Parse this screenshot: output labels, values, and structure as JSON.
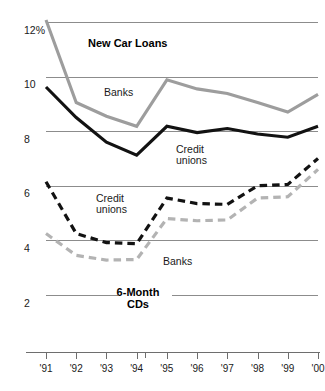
{
  "chart_data": {
    "type": "line",
    "title": "",
    "xlabel": "",
    "ylabel": "",
    "grid": true,
    "legend_position": "inline-annotations",
    "ylim": [
      2,
      12.8
    ],
    "yticks": [
      12,
      10,
      8,
      6,
      4,
      2
    ],
    "ytick_labels": [
      "12%",
      "10",
      "8",
      "6",
      "4",
      "2"
    ],
    "x": [
      "'91",
      "'92",
      "'93",
      "'94",
      "'95",
      "'96",
      "'97",
      "'98",
      "'99",
      "'00"
    ],
    "xlim": [
      "'91",
      "'00"
    ],
    "group_labels": {
      "upper": "New Car Loans",
      "lower_line1": "6-Month",
      "lower_line2": "CDs"
    },
    "annotations": [
      {
        "text": "New Car Loans",
        "x_px": 88,
        "y_px": 47,
        "bold": true
      },
      {
        "text": "Banks",
        "x_px": 104,
        "y_px": 96,
        "bold": false
      },
      {
        "text": "Credit",
        "x_px": 176,
        "y_px": 153,
        "bold": false
      },
      {
        "text": "unions",
        "x_px": 176,
        "y_px": 164,
        "bold": false
      },
      {
        "text": "Credit",
        "x_px": 96,
        "y_px": 202,
        "bold": false
      },
      {
        "text": "unions",
        "x_px": 96,
        "y_px": 213,
        "bold": false
      },
      {
        "text": "Banks",
        "x_px": 163,
        "y_px": 265,
        "bold": false
      },
      {
        "text": "6-Month",
        "x_px": 138,
        "y_px": 296,
        "bold": true
      },
      {
        "text": "CDs",
        "x_px": 138,
        "y_px": 308,
        "bold": true
      }
    ],
    "series": [
      {
        "name": "New Car Loans - Banks",
        "group": "New Car Loans",
        "style": "solid",
        "color": "#9d9d9d",
        "values": [
          12.75,
          9.05,
          8.55,
          8.18,
          9.88,
          9.55,
          9.38,
          9.05,
          8.7,
          9.35
        ]
      },
      {
        "name": "New Car Loans - Credit unions",
        "group": "New Car Loans",
        "style": "solid",
        "color": "#121212",
        "values": [
          9.62,
          8.5,
          7.6,
          7.12,
          8.18,
          7.95,
          8.1,
          7.9,
          7.78,
          8.18
        ]
      },
      {
        "name": "6-Month CDs - Credit unions",
        "group": "6-Month CDs",
        "style": "dashed",
        "color": "#121212",
        "values": [
          6.15,
          4.25,
          3.92,
          3.88,
          5.55,
          5.35,
          5.32,
          6.0,
          6.05,
          7.0
        ]
      },
      {
        "name": "6-Month CDs - Banks",
        "group": "6-Month CDs",
        "style": "dashed",
        "color": "#b3b3b3",
        "values": [
          4.25,
          3.45,
          3.28,
          3.3,
          4.8,
          4.72,
          4.75,
          5.55,
          5.6,
          6.6
        ]
      }
    ],
    "colors": {
      "dark_series": "#121212",
      "gray_series": "#9d9d9d",
      "gray_dashed_series": "#b3b3b3",
      "gridline": "#8c8c8c",
      "axis": "#6e6e6e",
      "background": "#ffffff"
    }
  }
}
